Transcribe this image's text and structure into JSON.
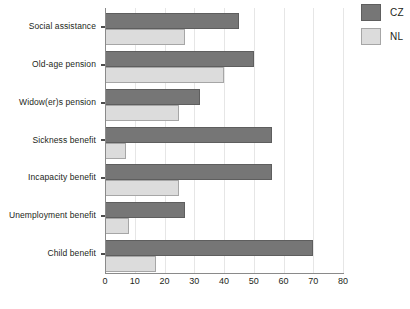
{
  "chart_data": {
    "type": "bar",
    "orientation": "horizontal",
    "title": "",
    "xlabel": "",
    "ylabel": "",
    "xlim": [
      0,
      80
    ],
    "xticks": [
      0,
      10,
      20,
      30,
      40,
      50,
      60,
      70,
      80
    ],
    "grid": true,
    "grid_axis": "x",
    "legend_position": "top-right",
    "categories": [
      "Social assistance",
      "Old-age pension",
      "Widow(er)s pension",
      "Sickness benefit",
      "Incapacity benefit",
      "Unemployment benefit",
      "Child benefit"
    ],
    "series": [
      {
        "name": "CZ",
        "color": "#767676",
        "values": [
          45,
          50,
          32,
          56,
          56,
          27,
          70
        ]
      },
      {
        "name": "NL",
        "color": "#dcdcdc",
        "values": [
          27,
          40,
          25,
          7,
          25,
          8,
          17
        ]
      }
    ]
  },
  "legend": {
    "items": [
      {
        "label": "CZ",
        "swatch": "cz"
      },
      {
        "label": "NL",
        "swatch": "nl"
      }
    ]
  }
}
